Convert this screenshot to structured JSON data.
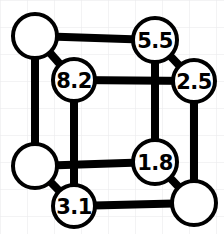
{
  "figure": {
    "type": "node-link-diagram",
    "shape": "cube-graph",
    "width": 224,
    "height": 234,
    "background_color": "#ffffff",
    "grid": {
      "visible": true,
      "spacing": 27,
      "color": "#e8e8ea",
      "line_width": 1
    },
    "style": {
      "node_fill": "#ffffff",
      "node_stroke": "#000000",
      "node_stroke_width": 4,
      "edge_color": "#000000",
      "edge_width": 8,
      "label_color": "#000000",
      "label_font_size": 21
    }
  },
  "nodes": [
    {
      "id": "back-top-left",
      "label": "",
      "cx": 35,
      "cy": 36,
      "r": 22,
      "labeled": false
    },
    {
      "id": "back-top-right",
      "label": "5.5",
      "cx": 155,
      "cy": 40,
      "r": 22,
      "labeled": true
    },
    {
      "id": "back-bottom-left",
      "label": "",
      "cx": 35,
      "cy": 166,
      "r": 22,
      "labeled": false
    },
    {
      "id": "back-bottom-right",
      "label": "1.8",
      "cx": 155,
      "cy": 162,
      "r": 22,
      "labeled": true
    },
    {
      "id": "front-top-left",
      "label": "8.2",
      "cx": 74,
      "cy": 80,
      "r": 21,
      "labeled": true
    },
    {
      "id": "front-top-right",
      "label": "2.5",
      "cx": 194,
      "cy": 81,
      "r": 21,
      "labeled": true
    },
    {
      "id": "front-bottom-left",
      "label": "3.1",
      "cx": 74,
      "cy": 206,
      "r": 21,
      "labeled": true
    },
    {
      "id": "front-bottom-right",
      "label": "",
      "cx": 194,
      "cy": 203,
      "r": 22,
      "labeled": false
    }
  ],
  "edges": [
    {
      "id": "edge-back-top",
      "from": "back-top-left",
      "to": "back-top-right",
      "face": "back"
    },
    {
      "id": "edge-back-left",
      "from": "back-top-left",
      "to": "back-bottom-left",
      "face": "back"
    },
    {
      "id": "edge-back-right",
      "from": "back-top-right",
      "to": "back-bottom-right",
      "face": "back"
    },
    {
      "id": "edge-back-bottom",
      "from": "back-bottom-left",
      "to": "back-bottom-right",
      "face": "back"
    },
    {
      "id": "edge-front-top",
      "from": "front-top-left",
      "to": "front-top-right",
      "face": "front"
    },
    {
      "id": "edge-front-left",
      "from": "front-top-left",
      "to": "front-bottom-left",
      "face": "front"
    },
    {
      "id": "edge-front-right",
      "from": "front-top-right",
      "to": "front-bottom-right",
      "face": "front"
    },
    {
      "id": "edge-front-bottom",
      "from": "front-bottom-left",
      "to": "front-bottom-right",
      "face": "front"
    },
    {
      "id": "edge-depth-top-left",
      "from": "back-top-left",
      "to": "front-top-left",
      "face": "depth"
    },
    {
      "id": "edge-depth-top-right",
      "from": "back-top-right",
      "to": "front-top-right",
      "face": "depth"
    },
    {
      "id": "edge-depth-bottom-left",
      "from": "back-bottom-left",
      "to": "front-bottom-left",
      "face": "depth"
    },
    {
      "id": "edge-depth-bottom-right",
      "from": "back-bottom-right",
      "to": "front-bottom-right",
      "face": "depth"
    }
  ],
  "values": {
    "back_top_right": "5.5",
    "back_bottom_right": "1.8",
    "front_top_left": "8.2",
    "front_top_right": "2.5",
    "front_bottom_left": "3.1"
  }
}
